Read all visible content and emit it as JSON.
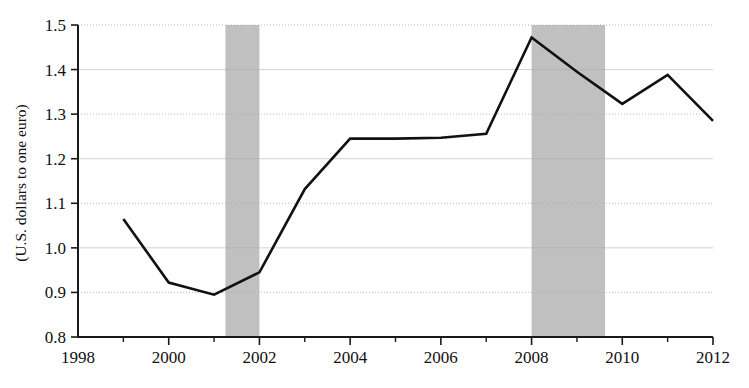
{
  "chart_data": {
    "type": "line",
    "title": "",
    "xlabel": "",
    "ylabel": "(U.S. dollars to one euro)",
    "x": [
      1999,
      2000,
      2001,
      2002,
      2003,
      2004,
      2005,
      2006,
      2007,
      2008,
      2009,
      2010,
      2011,
      2012
    ],
    "values": [
      1.065,
      0.922,
      0.895,
      0.945,
      1.132,
      1.245,
      1.245,
      1.247,
      1.256,
      1.472,
      1.395,
      1.323,
      1.388,
      1.285
    ],
    "series": [
      {
        "name": "U.S. dollars to one euro",
        "values": [
          1.065,
          0.922,
          0.895,
          0.945,
          1.132,
          1.245,
          1.245,
          1.247,
          1.256,
          1.472,
          1.395,
          1.323,
          1.388,
          1.285
        ]
      }
    ],
    "xlim": [
      1998,
      2012
    ],
    "ylim": [
      0.8,
      1.5
    ],
    "y_ticks": [
      0.8,
      0.9,
      1.0,
      1.1,
      1.2,
      1.3,
      1.4,
      1.5
    ],
    "y_tick_labels": [
      "0.8",
      "0.9",
      "1.0",
      "1.1",
      "1.2",
      "1.3",
      "1.4",
      "1.5"
    ],
    "x_ticks": [
      1998,
      2000,
      2002,
      2004,
      2006,
      2008,
      2010,
      2012
    ],
    "x_tick_labels": [
      "1998",
      "2000",
      "2002",
      "2004",
      "2006",
      "2008",
      "2010",
      "2012"
    ],
    "x_minor_ticks": [
      1999,
      2001,
      2003,
      2005,
      2007,
      2009,
      2011
    ],
    "grid": true,
    "legend": "none",
    "shaded_regions": [
      {
        "name": "recession-2001",
        "x_start": 2001.25,
        "x_end": 2002.0
      },
      {
        "name": "recession-2008",
        "x_start": 2008.0,
        "x_end": 2009.62
      }
    ],
    "colors": {
      "line": "#111111",
      "shaded_band": "#a8a8a8",
      "gridline": "#c8c8c8",
      "axis": "#1a1a1a",
      "background": "#ffffff"
    }
  }
}
